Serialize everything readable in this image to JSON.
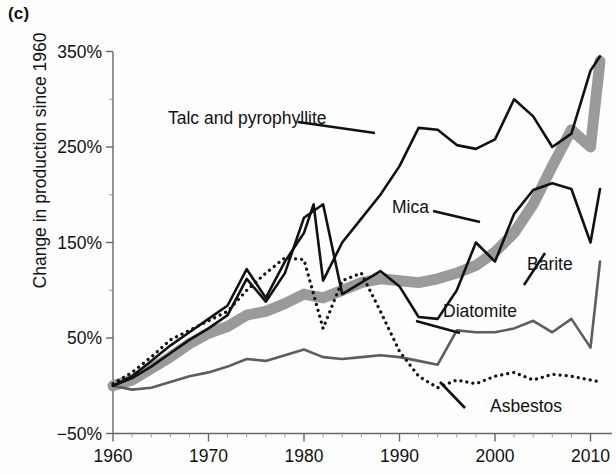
{
  "figure": {
    "panel_label": "(c)"
  },
  "chart_data": {
    "type": "line",
    "title": "",
    "xlabel": "",
    "ylabel": "Change in production since 1960",
    "xlim": [
      1960,
      2011
    ],
    "ylim": [
      -50,
      390
    ],
    "grid": false,
    "legend_position": "inline-annotations",
    "ytick_labels": [
      "350%",
      "250%",
      "150%",
      "50%",
      "−50%"
    ],
    "ytick_values": [
      350,
      250,
      150,
      50,
      -50
    ],
    "xtick_labels": [
      "1960",
      "1970",
      "1980",
      "1990",
      "2000",
      "2010"
    ],
    "xtick_values": [
      1960,
      1970,
      1980,
      1990,
      2000,
      2010
    ],
    "x_minor_step": 2,
    "y_unit": "percent",
    "series": [
      {
        "name": "Talc and pyrophyllite",
        "style": "thick-gray-band",
        "color": "#9a9a9a",
        "x": [
          1960,
          1962,
          1964,
          1966,
          1968,
          1970,
          1972,
          1974,
          1976,
          1978,
          1980,
          1982,
          1984,
          1986,
          1988,
          1990,
          1992,
          1994,
          1996,
          1998,
          2000,
          2002,
          2004,
          2006,
          2008,
          2010,
          2011
        ],
        "values": [
          0,
          6,
          18,
          30,
          44,
          55,
          62,
          74,
          78,
          86,
          96,
          92,
          100,
          108,
          112,
          110,
          108,
          112,
          118,
          126,
          140,
          160,
          190,
          230,
          268,
          250,
          340
        ]
      },
      {
        "name": "Mica",
        "style": "solid-black",
        "color": "#111111",
        "x": [
          1960,
          1962,
          1964,
          1966,
          1968,
          1970,
          1972,
          1974,
          1976,
          1978,
          1980,
          1981,
          1982,
          1984,
          1986,
          1988,
          1990,
          1992,
          1994,
          1996,
          1998,
          2000,
          2002,
          2004,
          2006,
          2008,
          2010,
          2011
        ],
        "values": [
          0,
          10,
          26,
          42,
          56,
          70,
          84,
          122,
          92,
          130,
          160,
          190,
          110,
          150,
          175,
          200,
          230,
          270,
          268,
          252,
          248,
          258,
          300,
          282,
          250,
          264,
          330,
          345
        ]
      },
      {
        "name": "Barite",
        "style": "solid-black",
        "color": "#111111",
        "x": [
          1960,
          1962,
          1964,
          1966,
          1968,
          1970,
          1972,
          1974,
          1976,
          1978,
          1980,
          1982,
          1984,
          1986,
          1988,
          1990,
          1992,
          1994,
          1996,
          1998,
          2000,
          2002,
          2004,
          2006,
          2008,
          2010,
          2011
        ],
        "values": [
          0,
          8,
          20,
          34,
          48,
          60,
          74,
          112,
          88,
          118,
          176,
          190,
          96,
          108,
          120,
          104,
          72,
          70,
          100,
          150,
          130,
          180,
          205,
          212,
          206,
          150,
          206
        ]
      },
      {
        "name": "Diatomite",
        "style": "solid-gray",
        "color": "#5d5d5d",
        "x": [
          1960,
          1962,
          1964,
          1966,
          1968,
          1970,
          1972,
          1974,
          1976,
          1978,
          1980,
          1982,
          1984,
          1986,
          1988,
          1990,
          1992,
          1994,
          1996,
          1998,
          2000,
          2002,
          2004,
          2006,
          2008,
          2010,
          2011
        ],
        "values": [
          0,
          -4,
          -2,
          4,
          10,
          14,
          20,
          28,
          26,
          32,
          38,
          30,
          28,
          30,
          32,
          30,
          26,
          22,
          58,
          56,
          56,
          60,
          68,
          56,
          70,
          40,
          130
        ]
      },
      {
        "name": "Asbestos",
        "style": "dotted-black",
        "color": "#111111",
        "x": [
          1960,
          1962,
          1964,
          1966,
          1968,
          1970,
          1972,
          1974,
          1976,
          1978,
          1980,
          1982,
          1984,
          1986,
          1988,
          1990,
          1992,
          1994,
          1996,
          1998,
          2000,
          2002,
          2004,
          2006,
          2008,
          2010,
          2011
        ],
        "values": [
          2,
          14,
          30,
          48,
          58,
          68,
          78,
          100,
          118,
          134,
          132,
          60,
          110,
          118,
          78,
          36,
          10,
          -2,
          6,
          2,
          10,
          14,
          6,
          12,
          10,
          6,
          4
        ]
      }
    ],
    "annotations": [
      {
        "text": "Talc and pyrophyllite",
        "x_px": 168,
        "y_px": 124
      },
      {
        "text": "Mica",
        "x_px": 392,
        "y_px": 213
      },
      {
        "text": "Barite",
        "x_px": 527,
        "y_px": 270
      },
      {
        "text": "Diatomite",
        "x_px": 443,
        "y_px": 317
      },
      {
        "text": "Asbestos",
        "x_px": 490,
        "y_px": 412
      }
    ]
  }
}
